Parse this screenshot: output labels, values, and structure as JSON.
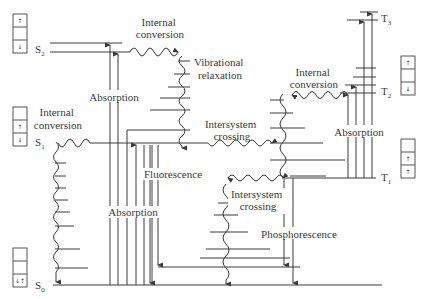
{
  "diagram": {
    "type": "Jablonski diagram",
    "states": {
      "S0": {
        "label": "S",
        "sub": "0"
      },
      "S1": {
        "label": "S",
        "sub": "1"
      },
      "S2": {
        "label": "S",
        "sub": "2"
      },
      "T1": {
        "label": "T",
        "sub": "1"
      },
      "T2": {
        "label": "T",
        "sub": "2"
      },
      "T3": {
        "label": "T",
        "sub": "3"
      }
    },
    "labels": {
      "ic_s2_l1": "Internal",
      "ic_s2_l2": "conversion",
      "vr_l1": "Vibrational",
      "vr_l2": "relaxation",
      "ic_s1_l1": "Internal",
      "ic_s1_l2": "conversion",
      "abs_top": "Absorption",
      "abs_bottom": "Absorption",
      "fluorescence": "Fluorescence",
      "isc1_l1": "Intersystem",
      "isc1_l2": "crossing",
      "isc2_l1": "Intersystem",
      "isc2_l2": "crossing",
      "ic_t_l1": "Internal",
      "ic_t_l2": "conversion",
      "abs_triplet": "Absorption",
      "phosphorescence": "Phosphorescence"
    },
    "spin_boxes": {
      "S2": [
        "↑",
        "",
        "↓"
      ],
      "S1": [
        "",
        "↑",
        "↓"
      ],
      "S0": [
        "",
        "",
        "↓↑"
      ],
      "T2": [
        "↑",
        "",
        "↓"
      ],
      "T1": [
        "",
        "↑",
        "↑"
      ]
    }
  }
}
